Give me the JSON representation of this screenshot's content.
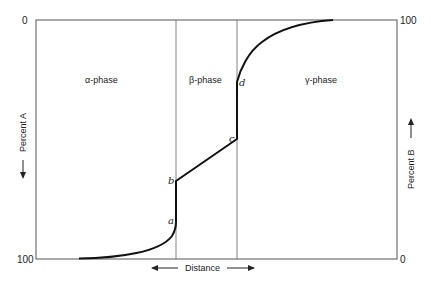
{
  "diagram": {
    "type": "concentration-distance profile",
    "left_axis": {
      "label": "Percent A",
      "top_tick": "0",
      "bottom_tick": "100",
      "arrow": "down"
    },
    "right_axis": {
      "label": "Percent B",
      "top_tick": "100",
      "bottom_tick": "0",
      "arrow": "up"
    },
    "x_axis": {
      "label": "Distance",
      "arrows": "both"
    },
    "phases": [
      {
        "label": "α-phase",
        "symbol": "α",
        "text": "-phase"
      },
      {
        "label": "β-phase",
        "symbol": "β",
        "text": "-phase"
      },
      {
        "label": "γ-phase",
        "symbol": "γ",
        "text": "-phase"
      }
    ],
    "points": [
      {
        "id": "a",
        "label": "a"
      },
      {
        "id": "b",
        "label": "b"
      },
      {
        "id": "c",
        "label": "c"
      },
      {
        "id": "d",
        "label": "d"
      }
    ],
    "colors": {
      "line": "#111111",
      "frame": "#555555"
    }
  }
}
